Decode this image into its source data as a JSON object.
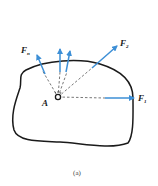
{
  "figure": {
    "caption": "(a)",
    "point_label": "A",
    "colors": {
      "force_arrow": "#3d8fd6",
      "outline": "#1a1a1a",
      "dash": "#555555"
    },
    "forces": [
      {
        "name": "F",
        "sub": "n"
      },
      {
        "name": "F",
        "sub": "2"
      },
      {
        "name": "F",
        "sub": "1"
      }
    ]
  }
}
